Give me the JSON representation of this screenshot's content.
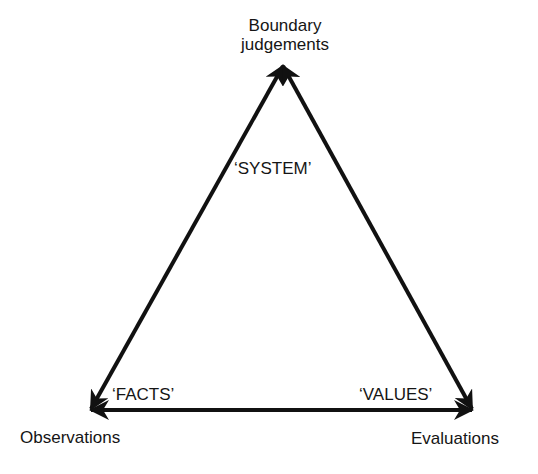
{
  "diagram": {
    "type": "triangle",
    "vertices": {
      "top": {
        "label_lines": [
          "Boundary",
          "judgements"
        ]
      },
      "bottom_left": {
        "label": "Observations"
      },
      "bottom_right": {
        "label": "Evaluations"
      }
    },
    "edge_labels": {
      "top": "‘SYSTEM’",
      "left": "‘FACTS’",
      "right": "‘VALUES’"
    },
    "edges": [
      {
        "from": "top",
        "to": "bottom_left",
        "arrows": "both"
      },
      {
        "from": "top",
        "to": "bottom_right",
        "arrows": "both"
      },
      {
        "from": "bottom_left",
        "to": "bottom_right",
        "arrows": "both"
      }
    ],
    "colors": {
      "line": "#111111",
      "background": "#ffffff"
    }
  }
}
